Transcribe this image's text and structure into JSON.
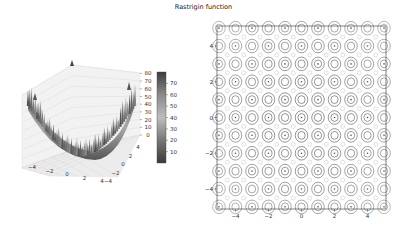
{
  "title": "Rastrigin function",
  "chart_data": [
    {
      "type": "surface3d",
      "title": "",
      "function": "Rastrigin: f(x,y) = 20 + x^2 - 10cos(2πx) + y^2 - 10cos(2πy)",
      "x_range": [
        -5.12,
        5.12
      ],
      "y_range": [
        -5.12,
        5.12
      ],
      "x_ticks": [
        "-4",
        "-2",
        "0",
        "2",
        "4"
      ],
      "y_ticks": [
        "-4",
        "-2",
        "0",
        "2",
        "4"
      ],
      "z_ticks": [
        "0",
        "10",
        "20",
        "30",
        "40",
        "50",
        "60",
        "70",
        "80"
      ],
      "z_range": [
        0,
        80
      ],
      "colormap": "gray",
      "colorbar": {
        "ticks": [
          "10",
          "20",
          "30",
          "40",
          "50",
          "60",
          "70"
        ],
        "range": [
          0,
          80
        ]
      },
      "grid": true
    },
    {
      "type": "contour",
      "function": "Rastrigin",
      "x_range": [
        -5.12,
        5.12
      ],
      "y_range": [
        -5.12,
        5.12
      ],
      "x_ticks": [
        "-4",
        "-2",
        "0",
        "2",
        "4"
      ],
      "y_ticks": [
        "4",
        "2",
        "0",
        "-2",
        "-4"
      ],
      "colormap": "gray",
      "grid": false
    }
  ],
  "labels": {
    "z": [
      "0",
      "10",
      "20",
      "30",
      "40",
      "50",
      "60",
      "70",
      "80"
    ],
    "cb": [
      "70",
      "60",
      "50",
      "40",
      "30",
      "20",
      "10"
    ],
    "x3d": [
      "-4",
      "-2",
      "0",
      "2",
      "4"
    ],
    "y3d": [
      "-4",
      "-2",
      "0",
      "2",
      "4"
    ],
    "cx": [
      "-4",
      "-2",
      "0",
      "2",
      "4"
    ],
    "cy": [
      "4",
      "2",
      "0",
      "-2",
      "-4"
    ]
  }
}
